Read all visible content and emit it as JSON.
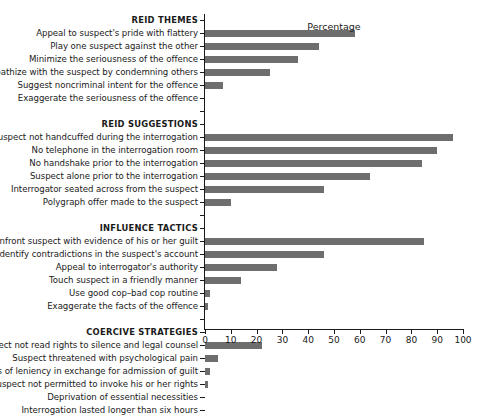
{
  "chart_data": {
    "type": "bar",
    "orientation": "horizontal",
    "title": "",
    "xlabel": "Percentage",
    "ylabel": "",
    "xlim": [
      0,
      100
    ],
    "xticks": [
      0,
      10,
      20,
      30,
      40,
      50,
      60,
      70,
      80,
      90,
      100
    ],
    "grid": false,
    "legend": "none",
    "bar_color": "#6e6e6e",
    "categories": [
      "REID THEMES",
      "Appeal to suspect's pride with flattery",
      "Play one suspect against the other",
      "Minimize the seriousness of the offence",
      "Sympathize with the suspect by condemning others",
      "Suggest noncriminal intent for the offence",
      "Exaggerate the seriousness of the offence",
      "REID SUGGESTIONS",
      "Suspect not handcuffed during the interrogation",
      "No telephone in the interrogation room",
      "No handshake prior to the interrogation",
      "Suspect alone prior to the interrogation",
      "Interrogator seated across from the suspect",
      "Polygraph offer made to the suspect",
      "INFLUENCE TACTICS",
      "Confront suspect with evidence of his or her guilt",
      "Identify contradictions in the suspect's account",
      "Appeal to interrogator's authority",
      "Touch suspect in a friendly manner",
      "Use good cop–bad cop routine",
      "Exaggerate the facts of the offence",
      "COERCIVE STRATEGIES",
      "Suspect not read rights to silence and legal counsel",
      "Suspect threatened with psychological pain",
      "Promises of leniency in exchange for admission of guilt",
      "Suspect not permitted to invoke his or her rights",
      "Deprivation of essential necessities",
      "Interrogation lasted longer than six hours"
    ],
    "values": [
      null,
      58,
      44,
      36,
      25,
      7,
      0,
      null,
      96,
      90,
      84,
      64,
      46,
      10,
      null,
      85,
      46,
      28,
      14,
      2,
      1,
      null,
      22,
      5,
      2,
      1,
      0,
      0
    ],
    "groups": [
      {
        "header": "REID THEMES",
        "items": [
          {
            "label": "Appeal to suspect's pride with flattery",
            "value": 58
          },
          {
            "label": "Play one suspect against the other",
            "value": 44
          },
          {
            "label": "Minimize the seriousness of the offence",
            "value": 36
          },
          {
            "label": "Sympathize with the suspect by condemning others",
            "value": 25
          },
          {
            "label": "Suggest noncriminal intent for the offence",
            "value": 7
          },
          {
            "label": "Exaggerate the seriousness of the offence",
            "value": 0
          }
        ]
      },
      {
        "header": "REID SUGGESTIONS",
        "items": [
          {
            "label": "Suspect not handcuffed during the interrogation",
            "value": 96
          },
          {
            "label": "No telephone in the interrogation room",
            "value": 90
          },
          {
            "label": "No handshake prior to the interrogation",
            "value": 84
          },
          {
            "label": "Suspect alone prior to the interrogation",
            "value": 64
          },
          {
            "label": "Interrogator seated across from the suspect",
            "value": 46
          },
          {
            "label": "Polygraph offer made to the suspect",
            "value": 10
          }
        ]
      },
      {
        "header": "INFLUENCE TACTICS",
        "items": [
          {
            "label": "Confront suspect with evidence of his or her guilt",
            "value": 85
          },
          {
            "label": "Identify contradictions in the suspect's account",
            "value": 46
          },
          {
            "label": "Appeal to interrogator's authority",
            "value": 28
          },
          {
            "label": "Touch suspect in a friendly manner",
            "value": 14
          },
          {
            "label": "Use good cop–bad cop routine",
            "value": 2
          },
          {
            "label": "Exaggerate the facts of the offence",
            "value": 1
          }
        ]
      },
      {
        "header": "COERCIVE STRATEGIES",
        "items": [
          {
            "label": "Suspect not read rights to silence and legal counsel",
            "value": 22
          },
          {
            "label": "Suspect threatened with psychological pain",
            "value": 5
          },
          {
            "label": "Promises of leniency in exchange for admission of guilt",
            "value": 2
          },
          {
            "label": "Suspect not permitted to invoke his or her rights",
            "value": 1
          },
          {
            "label": "Deprivation of essential necessities",
            "value": 0
          },
          {
            "label": "Interrogation lasted longer than six hours",
            "value": 0
          }
        ]
      }
    ]
  }
}
